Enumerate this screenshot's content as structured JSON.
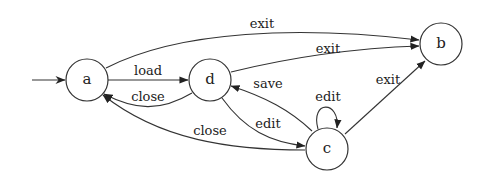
{
  "diagram": {
    "type": "state-machine",
    "initial_state": "a",
    "states": [
      {
        "id": "a",
        "label": "a"
      },
      {
        "id": "d",
        "label": "d"
      },
      {
        "id": "b",
        "label": "b"
      },
      {
        "id": "c",
        "label": "c"
      }
    ],
    "transitions": [
      {
        "from": "a",
        "to": "b",
        "label": "exit"
      },
      {
        "from": "a",
        "to": "d",
        "label": "load"
      },
      {
        "from": "d",
        "to": "a",
        "label": "close"
      },
      {
        "from": "d",
        "to": "b",
        "label": "exit"
      },
      {
        "from": "c",
        "to": "d",
        "label": "save"
      },
      {
        "from": "d",
        "to": "c",
        "label": "edit"
      },
      {
        "from": "c",
        "to": "c",
        "label": "edit"
      },
      {
        "from": "c",
        "to": "b",
        "label": "exit"
      },
      {
        "from": "c",
        "to": "a",
        "label": "close"
      }
    ]
  }
}
